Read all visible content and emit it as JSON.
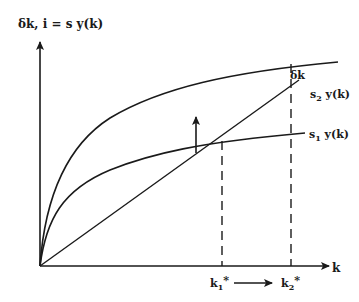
{
  "diagram": {
    "y_axis_label": "δk, i = s y(k)",
    "x_axis_label": "k",
    "depreciation_line_label": "δk",
    "curves": [
      {
        "id": "s2",
        "label_s": "s",
        "label_sub": "2",
        "label_rest": " y(k)"
      },
      {
        "id": "s1",
        "label_s": "s",
        "label_sub": "1",
        "label_rest": " y(k)"
      }
    ],
    "steady_states": [
      {
        "id": "k1",
        "label_k": "k",
        "label_sub": "1",
        "label_star": "*"
      },
      {
        "id": "k2",
        "label_k": "k",
        "label_sub": "2",
        "label_star": "*"
      }
    ],
    "annotations": {
      "shift_arrow": "upward shift from s1 y(k) to s2 y(k)",
      "movement_arrow": "k1* → k2*"
    },
    "colors": {
      "ink": "#1a1a1a",
      "background": "#ffffff"
    }
  }
}
